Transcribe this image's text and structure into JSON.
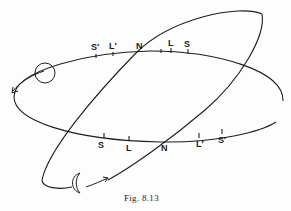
{
  "figure": {
    "caption": "Fig. 8.13"
  },
  "upper_intersection_labels": [
    {
      "id": "s-prime",
      "text": "S′"
    },
    {
      "id": "l-prime",
      "text": "L′"
    },
    {
      "id": "n",
      "text": "N"
    },
    {
      "id": "l",
      "text": "L"
    },
    {
      "id": "s",
      "text": "S"
    }
  ],
  "lower_intersection_labels": [
    {
      "id": "s",
      "text": "S"
    },
    {
      "id": "l",
      "text": "L"
    },
    {
      "id": "n",
      "text": "N"
    },
    {
      "id": "l-prime",
      "text": "L′"
    },
    {
      "id": "s-prime",
      "text": "S′"
    }
  ],
  "icons": {
    "circle": "circle-body-icon",
    "crescent": "crescent-moon-icon",
    "arrow_left": "orbit-direction-arrow-icon",
    "arrow_right": "orbit-direction-arrow-icon"
  },
  "colors": {
    "line": "#1e1e1e",
    "background": "#fdfdfd"
  }
}
